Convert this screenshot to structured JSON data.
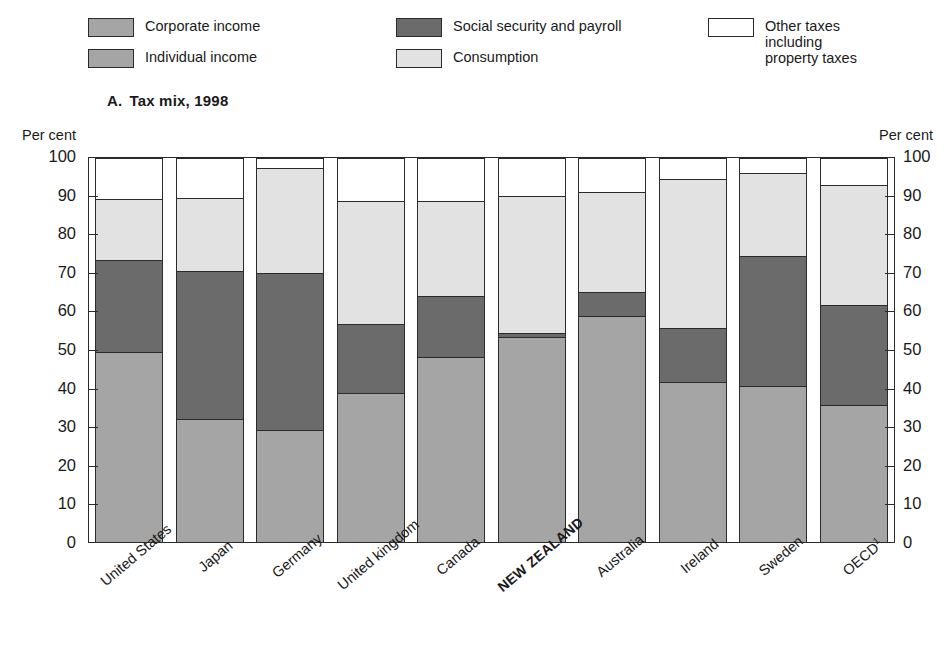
{
  "panel": {
    "letter": "A.",
    "title": "Tax mix, 1998"
  },
  "axis": {
    "unit_left": "Per cent",
    "unit_right": "Per cent",
    "ticks": [
      "100",
      "90",
      "80",
      "70",
      "60",
      "50",
      "40",
      "30",
      "20",
      "10",
      "0"
    ]
  },
  "legend": {
    "items": [
      {
        "key": "corporate",
        "label": "Corporate income",
        "color": "#a5a5a5"
      },
      {
        "key": "individual",
        "label": "Individual income",
        "color": "#a5a5a5"
      },
      {
        "key": "social",
        "label": "Social security and payroll",
        "color": "#6b6b6b"
      },
      {
        "key": "consumption",
        "label": "Consumption",
        "color": "#e2e2e2"
      },
      {
        "key": "other",
        "label": "Other taxes including\nproperty taxes",
        "color": "#ffffff"
      }
    ]
  },
  "chart_data": {
    "type": "bar",
    "subtype": "stacked-100",
    "xlabel": "",
    "ylabel": "Per cent",
    "ylim": [
      0,
      100
    ],
    "ytick_step": 10,
    "grid": false,
    "legend_position": "top",
    "categories": [
      "United States",
      "Japan",
      "Germany",
      "United kingdom",
      "Canada",
      "NEW ZEALAND",
      "Australia",
      "Ireland",
      "Sweden",
      "OECD"
    ],
    "category_notes": {
      "OECD": "1"
    },
    "highlight_category": "NEW ZEALAND",
    "series": [
      {
        "name": "Corporate income",
        "color": "#a5a5a5",
        "values": [
          9.2,
          13.5,
          4.7,
          11.0,
          10.7,
          11.0,
          15.5,
          10.8,
          6.0,
          9.3
        ]
      },
      {
        "name": "Individual income",
        "color": "#a5a5a5",
        "values": [
          40.4,
          18.5,
          24.4,
          27.7,
          37.4,
          42.4,
          43.3,
          30.9,
          34.7,
          26.5
        ]
      },
      {
        "name": "Social security and payroll",
        "color": "#6b6b6b",
        "values": [
          23.9,
          38.5,
          40.9,
          18.0,
          16.0,
          1.0,
          6.3,
          14.0,
          33.8,
          25.9
        ]
      },
      {
        "name": "Consumption",
        "color": "#e2e2e2",
        "values": [
          15.9,
          19.1,
          27.5,
          32.0,
          24.6,
          35.6,
          26.0,
          38.8,
          21.6,
          31.2
        ]
      },
      {
        "name": "Other taxes including property taxes",
        "color": "#ffffff",
        "values": [
          10.6,
          10.4,
          2.5,
          11.3,
          11.3,
          10.0,
          8.9,
          5.5,
          3.9,
          7.1
        ]
      }
    ]
  }
}
